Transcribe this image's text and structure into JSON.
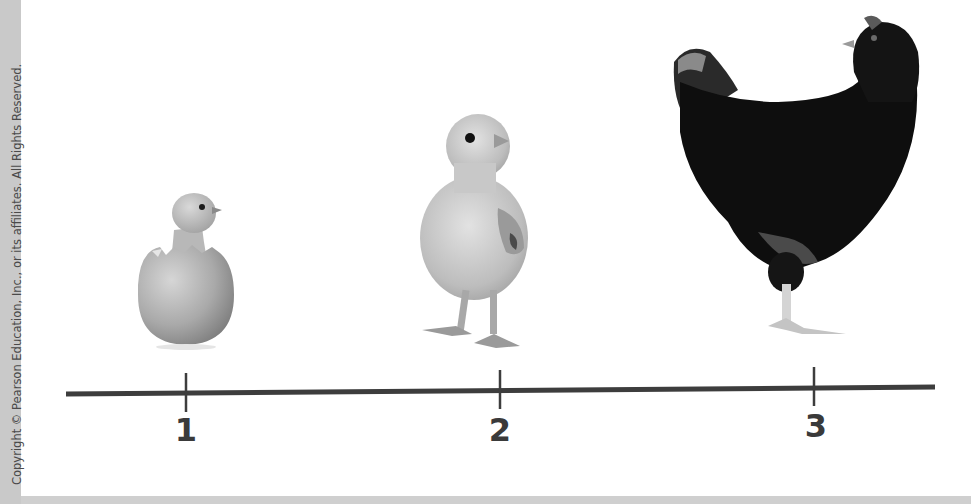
{
  "copyright": "Copyright © Pearson Education, Inc., or its affiliates. All Rights Reserved.",
  "timeline": {
    "line_color": "#3d3d3d",
    "ticks": [
      {
        "label": "1",
        "x": 186,
        "stage": "chick hatching from egg"
      },
      {
        "label": "2",
        "x": 500,
        "stage": "young chick"
      },
      {
        "label": "3",
        "x": 814,
        "stage": "adult hen"
      }
    ]
  },
  "illustrations": [
    {
      "name": "hatching-chick",
      "description": "chick hatching from egg"
    },
    {
      "name": "young-chick",
      "description": "fluffy young chick"
    },
    {
      "name": "adult-hen",
      "description": "black adult hen"
    }
  ]
}
